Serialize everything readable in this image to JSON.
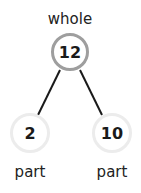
{
  "diagram": {
    "type": "number-bond",
    "whole": {
      "label": "whole",
      "value": "12"
    },
    "parts": [
      {
        "label": "part",
        "value": "2"
      },
      {
        "label": "part",
        "value": "10"
      }
    ],
    "colors": {
      "whole_border": "#9e9e9e",
      "part_border": "#ececec",
      "line": "#1a1a1a",
      "text": "#1a1a1a"
    }
  }
}
